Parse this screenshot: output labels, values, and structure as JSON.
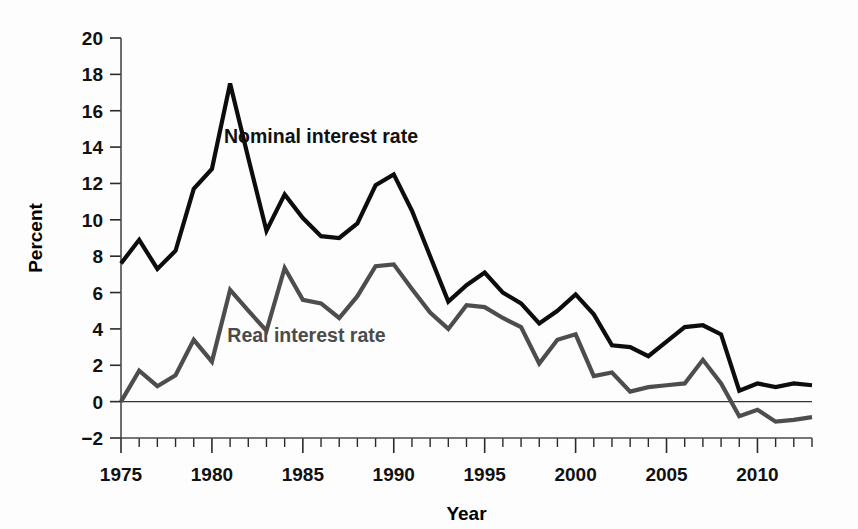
{
  "chart_data": {
    "type": "line",
    "title": "",
    "xlabel": "Year",
    "ylabel": "Percent",
    "xlim": [
      1975,
      2013
    ],
    "ylim": [
      -2,
      20
    ],
    "ytick_step": 2,
    "xtick_step": 1,
    "xtick_label_step": 5,
    "grid": false,
    "legend": "inline-annotations",
    "yticks": [
      20,
      18,
      16,
      14,
      12,
      10,
      8,
      6,
      4,
      2,
      0,
      -2
    ],
    "ytick_labels": [
      "20",
      "18",
      "16",
      "14",
      "12",
      "10",
      "8",
      "6",
      "4",
      "2",
      "0",
      "−2"
    ],
    "xticks": [
      1975,
      1976,
      1977,
      1978,
      1979,
      1980,
      1981,
      1982,
      1983,
      1984,
      1985,
      1986,
      1987,
      1988,
      1989,
      1990,
      1991,
      1992,
      1993,
      1994,
      1995,
      1996,
      1997,
      1998,
      1999,
      2000,
      2001,
      2002,
      2003,
      2004,
      2005,
      2006,
      2007,
      2008,
      2009,
      2010,
      2011,
      2012,
      2013
    ],
    "xtick_labels": [
      "1975",
      "1980",
      "1985",
      "1990",
      "1995",
      "2000",
      "2005",
      "2010"
    ],
    "xtick_label_years": [
      1975,
      1980,
      1985,
      1990,
      1995,
      2000,
      2005,
      2010
    ],
    "x": [
      1975,
      1976,
      1977,
      1978,
      1979,
      1980,
      1981,
      1982,
      1983,
      1984,
      1985,
      1986,
      1987,
      1988,
      1989,
      1990,
      1991,
      1992,
      1993,
      1994,
      1995,
      1996,
      1997,
      1998,
      1999,
      2000,
      2001,
      2002,
      2003,
      2004,
      2005,
      2006,
      2007,
      2008,
      2009,
      2010,
      2011,
      2012,
      2013
    ],
    "series": [
      {
        "name": "Nominal interest rate",
        "color": "#0d0d0d",
        "annotation_x": 1986.0,
        "annotation_y": 14.2,
        "values": [
          7.6,
          8.9,
          7.3,
          8.3,
          11.7,
          12.8,
          17.5,
          13.4,
          9.4,
          11.4,
          10.1,
          9.1,
          9.0,
          9.8,
          11.9,
          12.5,
          10.5,
          8.0,
          5.5,
          6.4,
          7.1,
          6.0,
          5.4,
          4.3,
          5.0,
          5.9,
          4.8,
          3.1,
          3.0,
          2.5,
          3.3,
          4.1,
          4.2,
          3.7,
          0.6,
          1.0,
          0.8,
          1.0,
          0.9
        ]
      },
      {
        "name": "Real interest rate",
        "color": "#4d4d4d",
        "annotation_x": 1985.2,
        "annotation_y": 3.3,
        "values": [
          0.0,
          1.7,
          0.85,
          1.45,
          3.4,
          2.2,
          6.15,
          5.0,
          3.9,
          7.35,
          5.6,
          5.4,
          4.6,
          5.8,
          7.45,
          7.55,
          6.2,
          4.9,
          4.0,
          5.3,
          5.2,
          4.6,
          4.1,
          2.1,
          3.4,
          3.7,
          1.4,
          1.6,
          0.55,
          0.8,
          0.9,
          1.0,
          2.3,
          1.0,
          -0.8,
          -0.45,
          -1.1,
          -1.0,
          -0.85
        ]
      }
    ]
  },
  "axis_titles": {
    "y": "Percent",
    "x": "Year"
  }
}
